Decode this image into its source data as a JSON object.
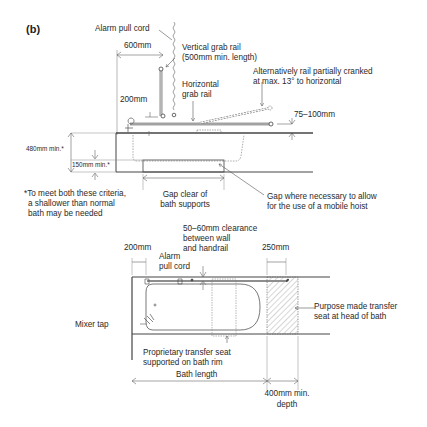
{
  "figure": {
    "label": "(b)"
  },
  "elevation": {
    "alarm_pull_cord": "Alarm pull cord",
    "dim_600": "600mm",
    "vertical_rail_line1": "Vertical grab rail",
    "vertical_rail_line2": "(500mm min. length)",
    "alt_rail_line1": "Alternatively rail partially cranked",
    "alt_rail_line2": "at max. 13° to horizontal",
    "horizontal_rail_line1": "Horizontal",
    "horizontal_rail_line2": "grab rail",
    "dim_200": "200mm",
    "dim_75_100": "75–100mm",
    "dim_480": "480mm min.*",
    "dim_150": "150mm min.*",
    "footnote_line1": "*To meet both these criteria,",
    "footnote_line2": "a shallower than normal",
    "footnote_line3": "bath may be needed",
    "gap_supports_line1": "Gap clear of",
    "gap_supports_line2": "bath supports",
    "gap_hoist_line1": "Gap where necessary to allow",
    "gap_hoist_line2": "for the use of a mobile hoist"
  },
  "plan": {
    "clearance_line1": "50–60mm clearance",
    "clearance_line2": "between wall",
    "clearance_line3": "and handrail",
    "dim_200": "200mm",
    "dim_250": "250mm",
    "alarm_line1": "Alarm",
    "alarm_line2": "pull cord",
    "transfer_seat_head_line1": "Purpose made transfer",
    "transfer_seat_head_line2": "seat at head of bath",
    "mixer_tap": "Mixer tap",
    "proprietary_seat_line1": "Proprietary transfer seat",
    "proprietary_seat_line2": "supported on bath rim",
    "bath_length": "Bath length",
    "dim_400_line1": "400mm min.",
    "dim_400_line2": "depth"
  }
}
